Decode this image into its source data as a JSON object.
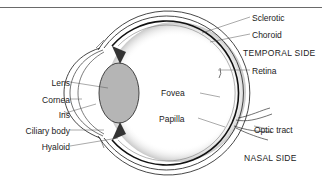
{
  "diagram": {
    "type": "anatomical-cross-section",
    "labels_left": [
      {
        "id": "lens",
        "text": "Lens"
      },
      {
        "id": "cornea",
        "text": "Cornea"
      },
      {
        "id": "iris",
        "text": "Iris"
      },
      {
        "id": "ciliary_body",
        "text": "Ciliary body"
      },
      {
        "id": "hyaloid",
        "text": "Hyaloid"
      }
    ],
    "labels_center": [
      {
        "id": "fovea",
        "text": "Fovea"
      },
      {
        "id": "papilla",
        "text": "Papilla"
      }
    ],
    "labels_right": [
      {
        "id": "sclerotic",
        "text": "Sclerotic"
      },
      {
        "id": "choroid",
        "text": "Choroid"
      },
      {
        "id": "retina",
        "text": "Retina"
      },
      {
        "id": "optic_tract",
        "text": "Optic tract"
      }
    ],
    "sides": {
      "temporal": "TEMPORAL SIDE",
      "nasal": "NASAL SIDE"
    },
    "colors": {
      "lens_fill": "#b5b5b5",
      "line": "#2a2a2a",
      "background": "#ffffff"
    }
  }
}
